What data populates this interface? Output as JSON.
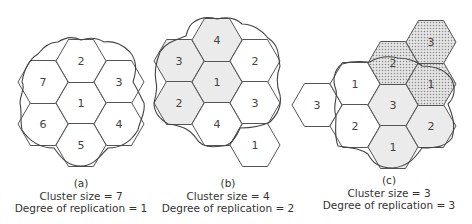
{
  "colors": {
    "background": "#ffffff",
    "hex_stroke": "#555555",
    "white_fill": "#ffffff",
    "gray_fill": "#ebebeb",
    "dotted_fill": "#cfcfcf",
    "text": "#333333"
  },
  "hex_geometry": {
    "radius": 25,
    "half_height": 21.5,
    "orientation": "flat-top"
  },
  "diagrams": [
    {
      "id": "a",
      "label": "(a)",
      "cluster_size_text": "Cluster size = 7",
      "replication_text": "Degree of replication = 1",
      "cells": [
        {
          "n": "1",
          "x": 81,
          "y": 103,
          "fill": "white"
        },
        {
          "n": "2",
          "x": 81,
          "y": 61,
          "fill": "white"
        },
        {
          "n": "3",
          "x": 119,
          "y": 82,
          "fill": "white"
        },
        {
          "n": "4",
          "x": 119,
          "y": 124,
          "fill": "white"
        },
        {
          "n": "5",
          "x": 81,
          "y": 145,
          "fill": "white"
        },
        {
          "n": "6",
          "x": 43,
          "y": 124,
          "fill": "white"
        },
        {
          "n": "7",
          "x": 43,
          "y": 82,
          "fill": "white"
        }
      ]
    },
    {
      "id": "b",
      "label": "(b)",
      "cluster_size_text": "Cluster size = 4",
      "replication_text": "Degree of replication = 2",
      "cells": [
        {
          "n": "1",
          "x": 217,
          "y": 82,
          "fill": "gray"
        },
        {
          "n": "4",
          "x": 217,
          "y": 40,
          "fill": "gray"
        },
        {
          "n": "3",
          "x": 179,
          "y": 61,
          "fill": "gray"
        },
        {
          "n": "2",
          "x": 179,
          "y": 103,
          "fill": "gray"
        },
        {
          "n": "2",
          "x": 255,
          "y": 61,
          "fill": "white"
        },
        {
          "n": "3",
          "x": 255,
          "y": 103,
          "fill": "white"
        },
        {
          "n": "4",
          "x": 217,
          "y": 124,
          "fill": "white"
        },
        {
          "n": "1",
          "x": 255,
          "y": 145,
          "fill": "white"
        }
      ]
    },
    {
      "id": "c",
      "label": "(c)",
      "cluster_size_text": "Cluster size = 3",
      "replication_text": "Degree of replication = 3",
      "cells": [
        {
          "n": "3",
          "x": 317,
          "y": 105,
          "fill": "white"
        },
        {
          "n": "1",
          "x": 355,
          "y": 84,
          "fill": "white"
        },
        {
          "n": "2",
          "x": 355,
          "y": 126,
          "fill": "white"
        },
        {
          "n": "3",
          "x": 393,
          "y": 105,
          "fill": "gray"
        },
        {
          "n": "1",
          "x": 393,
          "y": 147,
          "fill": "gray"
        },
        {
          "n": "2",
          "x": 431,
          "y": 126,
          "fill": "gray"
        },
        {
          "n": "2",
          "x": 393,
          "y": 63,
          "fill": "dotted"
        },
        {
          "n": "1",
          "x": 431,
          "y": 84,
          "fill": "dotted"
        },
        {
          "n": "3",
          "x": 431,
          "y": 42,
          "fill": "dotted"
        }
      ]
    }
  ]
}
